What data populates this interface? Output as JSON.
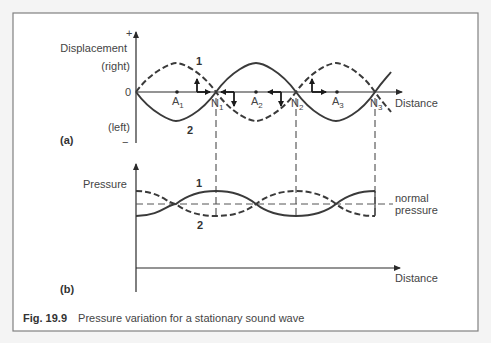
{
  "figure": {
    "number": "Fig. 19.9",
    "caption": "Pressure variation for a stationary sound wave"
  },
  "panel_a": {
    "tag": "(a)",
    "y_label": "Displacement",
    "y_plus": "+",
    "y_minus": "−",
    "y_upper": "(right)",
    "y_lower": "(left)",
    "origin": "0",
    "x_label": "Distance",
    "curve_labels": [
      "1",
      "2"
    ],
    "antinodes": [
      {
        "main": "A",
        "sub": "1"
      },
      {
        "main": "A",
        "sub": "2"
      },
      {
        "main": "A",
        "sub": "3"
      }
    ],
    "nodes": [
      {
        "main": "N",
        "sub": "1"
      },
      {
        "main": "N",
        "sub": "2"
      },
      {
        "main": "N",
        "sub": "3"
      }
    ]
  },
  "panel_b": {
    "tag": "(b)",
    "y_label": "Pressure",
    "x_label": "Distance",
    "ref_line_1": "normal",
    "ref_line_2": "pressure",
    "curve_labels": [
      "1",
      "2"
    ]
  },
  "colors": {
    "ink": "#3a3a3a",
    "border": "#808080",
    "background": "#ffffff"
  }
}
